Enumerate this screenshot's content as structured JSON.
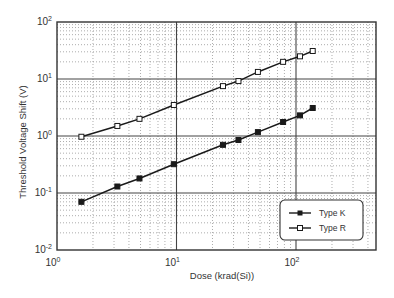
{
  "chart_data": {
    "type": "line",
    "title": "",
    "xlabel": "Dose (krad(Si))",
    "ylabel": "Threshold Voltage Shift (V)",
    "xscale": "log",
    "yscale": "log",
    "xlim": [
      1,
      500
    ],
    "ylim": [
      0.01,
      100
    ],
    "grid": true,
    "legend_position": "lower right",
    "x_ticks": [
      {
        "value": 1,
        "base": "10",
        "exp": "0"
      },
      {
        "value": 10,
        "base": "10",
        "exp": "1"
      },
      {
        "value": 100,
        "base": "10",
        "exp": "2"
      }
    ],
    "y_ticks": [
      {
        "value": 0.01,
        "base": "10",
        "exp": "-2"
      },
      {
        "value": 0.1,
        "base": "10",
        "exp": "-1"
      },
      {
        "value": 1,
        "base": "10",
        "exp": "0"
      },
      {
        "value": 10,
        "base": "10",
        "exp": "1"
      },
      {
        "value": 100,
        "base": "10",
        "exp": "2"
      }
    ],
    "series": [
      {
        "name": "Type K",
        "marker": "filled-square",
        "x": [
          1.6,
          3.2,
          4.9,
          9.5,
          24.5,
          33,
          48,
          78,
          108,
          138
        ],
        "values": [
          0.07,
          0.13,
          0.18,
          0.32,
          0.7,
          0.85,
          1.17,
          1.76,
          2.3,
          3.1
        ]
      },
      {
        "name": "Type R",
        "marker": "open-square",
        "x": [
          1.6,
          3.2,
          4.9,
          9.5,
          24.5,
          33,
          48,
          78,
          108,
          138
        ],
        "values": [
          0.97,
          1.5,
          2.0,
          3.5,
          7.5,
          9.2,
          13.3,
          20,
          25,
          31
        ]
      }
    ]
  },
  "legend": {
    "items": [
      {
        "label": "Type K",
        "marker": "filled-square"
      },
      {
        "label": "Type R",
        "marker": "open-square"
      }
    ]
  },
  "colors": {
    "line": "#1a1a1a",
    "frame": "#333333",
    "grid_major": "#444444",
    "grid_minor": "#8a8a8a",
    "background": "#ffffff"
  }
}
